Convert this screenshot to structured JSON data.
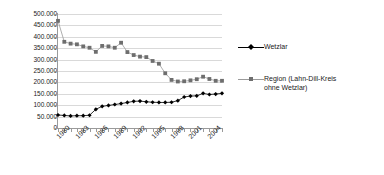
{
  "chart_data": {
    "type": "line",
    "title": "",
    "xlabel": "",
    "ylabel": "",
    "ylim": [
      0,
      500000
    ],
    "ytick_step": 50000,
    "grid": true,
    "legend_position": "right",
    "x": [
      1980,
      1981,
      1982,
      1983,
      1984,
      1985,
      1986,
      1987,
      1988,
      1989,
      1990,
      1991,
      1992,
      1993,
      1994,
      1995,
      1996,
      1997,
      1998,
      1999,
      2000,
      2001,
      2002,
      2003,
      2004,
      2005,
      2006
    ],
    "x_tick_labels": [
      "1980",
      "1983",
      "1986",
      "1989",
      "1992",
      "1995",
      "1998",
      "2001",
      "2004"
    ],
    "x_tick_label_years": [
      1980,
      1983,
      1986,
      1989,
      1992,
      1995,
      1998,
      2001,
      2004
    ],
    "y_tick_labels": [
      "500.000",
      "450.000",
      "400.000",
      "350.000",
      "300.000",
      "250.000",
      "200.000",
      "150.000",
      "100.000",
      "50.000",
      "0"
    ],
    "y_tick_values": [
      500000,
      450000,
      400000,
      350000,
      300000,
      250000,
      200000,
      150000,
      100000,
      50000,
      0
    ],
    "series": [
      {
        "name": "Wetzlar",
        "color": "#000000",
        "marker": "diamond",
        "values": [
          57000,
          55000,
          53000,
          54000,
          54000,
          56000,
          82000,
          95000,
          99000,
          103000,
          107000,
          112000,
          117000,
          118000,
          115000,
          113000,
          112000,
          112000,
          113000,
          120000,
          136000,
          140000,
          141000,
          152000,
          147000,
          149000,
          152000
        ]
      },
      {
        "name": "Region (Lahn-Dill-Kreis\nohne Wetzlar)",
        "color": "#808080",
        "marker": "square",
        "values": [
          470000,
          378000,
          370000,
          367000,
          358000,
          352000,
          334000,
          360000,
          358000,
          352000,
          374000,
          333000,
          320000,
          313000,
          311000,
          294000,
          282000,
          240000,
          211000,
          204000,
          205000,
          209000,
          214000,
          225000,
          215000,
          207000,
          207000
        ]
      }
    ]
  },
  "legend": {
    "items": [
      {
        "label": "Wetzlar",
        "color": "#000000",
        "marker": "diamond"
      },
      {
        "label": "Region (Lahn-Dill-Kreis\nohne Wetzlar)",
        "color": "#808080",
        "marker": "square"
      }
    ]
  }
}
